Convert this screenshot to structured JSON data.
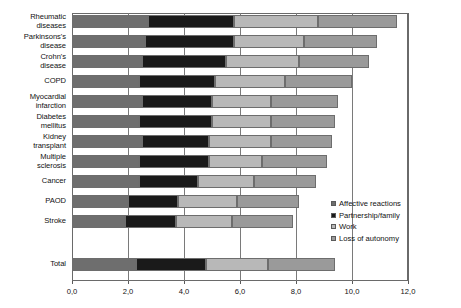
{
  "chart_data": {
    "type": "bar",
    "orientation": "horizontal",
    "stacked": true,
    "title": "",
    "subtitle": "",
    "xlabel": "",
    "ylabel": "",
    "xlim": [
      0.0,
      12.0
    ],
    "xticks": [
      "0,0",
      "2,0",
      "4,0",
      "6,0",
      "8,0",
      "10,0",
      "12,0"
    ],
    "xtick_values": [
      0.0,
      2.0,
      4.0,
      6.0,
      8.0,
      10.0,
      12.0
    ],
    "grid": true,
    "grid_axis": "x",
    "legend_position": "right-bottom",
    "decimal_separator": ",",
    "categories": [
      "Rheumatic diseases",
      "Parkinsons's disease",
      "Crohn's disease",
      "COPD",
      "Myocardial infarction",
      "Diabetes mellitus",
      "Kidney transplant",
      "Multiple sclerosis",
      "Cancer",
      "PAOD",
      "Stroke",
      "Total"
    ],
    "series": [
      {
        "name": "Affective reactions",
        "color": "#6e6e6e",
        "values": [
          2.7,
          2.6,
          2.5,
          2.4,
          2.5,
          2.4,
          2.5,
          2.4,
          2.4,
          2.0,
          1.9,
          2.3
        ]
      },
      {
        "name": "Partnership/family",
        "color": "#1a1a1a",
        "values": [
          3.1,
          3.2,
          3.0,
          2.7,
          2.5,
          2.6,
          2.4,
          2.5,
          2.1,
          1.8,
          1.8,
          2.5
        ]
      },
      {
        "name": "Work",
        "color": "#b8b8b8",
        "values": [
          3.0,
          2.5,
          2.6,
          2.5,
          2.1,
          2.1,
          2.2,
          1.9,
          2.0,
          2.1,
          2.0,
          2.2
        ]
      },
      {
        "name": "Loss of autonomy",
        "color": "#9a9a9a",
        "values": [
          2.8,
          2.6,
          2.5,
          2.4,
          2.4,
          2.3,
          2.2,
          2.3,
          2.2,
          2.2,
          2.2,
          2.4
        ]
      }
    ],
    "totals": [
      11.6,
      10.9,
      10.6,
      10.0,
      9.5,
      9.4,
      9.3,
      9.1,
      8.7,
      8.1,
      7.9,
      9.4
    ]
  },
  "legend": {
    "items": [
      {
        "label": "Affective reactions",
        "color": "#6e6e6e"
      },
      {
        "label": "Partnership/family",
        "color": "#1a1a1a"
      },
      {
        "label": "Work",
        "color": "#b8b8b8"
      },
      {
        "label": "Loss of autonomy",
        "color": "#9a9a9a"
      }
    ]
  },
  "colors": {
    "plot_background": "#ffffff",
    "gridline": "#7a7a7a",
    "axis": "#5a5a5a",
    "text": "#111111"
  }
}
